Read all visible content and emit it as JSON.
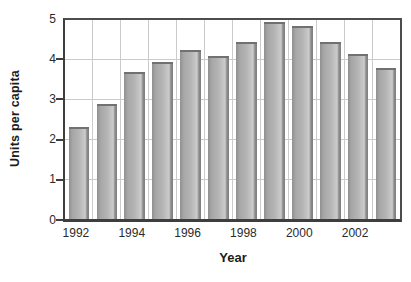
{
  "chart_data": {
    "type": "bar",
    "title": "",
    "categories": [
      "1992",
      "1993",
      "1994",
      "1995",
      "1996",
      "1997",
      "1998",
      "1999",
      "2000",
      "2001",
      "2002",
      "2003"
    ],
    "values": [
      2.3,
      2.9,
      3.7,
      3.95,
      4.25,
      4.1,
      4.45,
      4.95,
      4.85,
      4.45,
      4.15,
      3.8
    ],
    "xlabel": "Year",
    "ylabel": "Units per capita",
    "ylim": [
      0,
      5
    ],
    "yticks": [
      0,
      1,
      2,
      3,
      4,
      5
    ],
    "ytick_marks": [
      0,
      1,
      2,
      3,
      4
    ],
    "xtick_labels": [
      "1992",
      "1994",
      "1996",
      "1998",
      "2000",
      "2002"
    ],
    "xtick_slot_indices": [
      0,
      2,
      4,
      6,
      8,
      10
    ],
    "grid": "horizontal and vertical light-gray gridlines inside framed plot",
    "legend": "none"
  },
  "colors": {
    "frame": "#4d4d4d",
    "axis": "#3e3e3e",
    "gridline": "#cbcbcb",
    "bar_dark_left": "#909090",
    "bar_mid1": "#a7a7a7",
    "bar_mid2": "#b4b4b4",
    "bar_light1": "#c6c6c6",
    "bar_light2": "#cccccc",
    "bar_dark_right": "#8c8c8c",
    "bar_dark_edge": "#7e7e7e",
    "bar_top_cap": "#717171",
    "text": "#2a2a2a",
    "background": "#ffffff"
  }
}
